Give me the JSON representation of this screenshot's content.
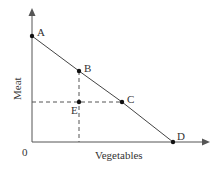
{
  "diagram": {
    "type": "production-possibilities-frontier",
    "x_axis_label": "Vegetables",
    "y_axis_label": "Meat",
    "origin_label": "0",
    "points": [
      {
        "label": "A",
        "x": 32,
        "y": 36
      },
      {
        "label": "B",
        "x": 79,
        "y": 71
      },
      {
        "label": "C",
        "x": 122,
        "y": 102
      },
      {
        "label": "D",
        "x": 173,
        "y": 142
      },
      {
        "label": "E",
        "x": 79,
        "y": 102
      }
    ],
    "colors": {
      "line": "#444444",
      "axis": "#555555",
      "point": "#111111",
      "text": "#333333"
    }
  }
}
